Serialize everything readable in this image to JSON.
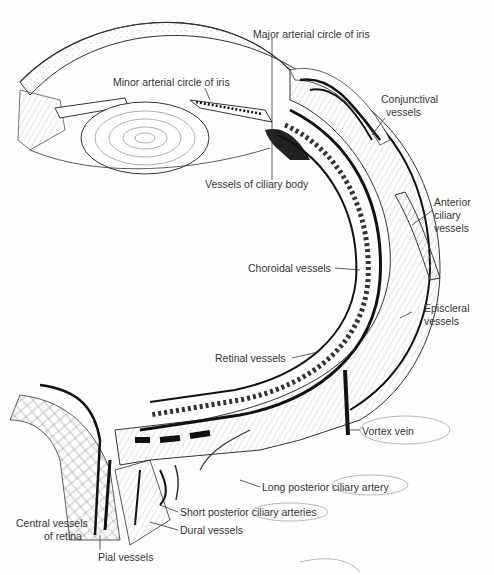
{
  "figure": {
    "labels": {
      "major_arterial_circle": "Major arterial circle of iris",
      "minor_arterial_circle": "Minor arterial circle of iris",
      "conjunctival_1": "Conjunctival",
      "conjunctival_2": "vessels",
      "vessels_ciliary_body": "Vessels of ciliary body",
      "anterior_ciliary_1": "Anterior",
      "anterior_ciliary_2": "ciliary",
      "anterior_ciliary_3": "vessels",
      "choroidal": "Choroidal vessels",
      "episcleral_1": "Episcleral",
      "episcleral_2": "vessels",
      "retinal": "Retinal vessels",
      "vortex_vein": "Vortex vein",
      "long_posterior": "Long posterior ciliary artery",
      "short_posterior": "Short posterior ciliary arteries",
      "dural": "Dural vessels",
      "central_1": "Central vessels",
      "central_2": "of retina",
      "pial": "Pial vessels"
    }
  }
}
